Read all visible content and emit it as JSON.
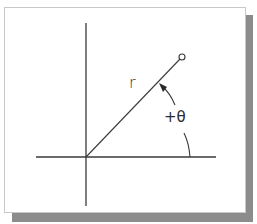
{
  "diagram": {
    "labels": {
      "radius": "r",
      "angle": "+θ"
    },
    "elements": {
      "x_axis": {
        "x1": 36,
        "y1": 157,
        "x2": 216,
        "y2": 157
      },
      "y_axis": {
        "x1": 86,
        "y1": 23,
        "x2": 86,
        "y2": 206
      },
      "radius_line": {
        "x1": 86,
        "y1": 157,
        "x2": 180,
        "y2": 59
      },
      "endpoint_circle": {
        "cx": 182,
        "cy": 57,
        "r": 3
      },
      "angle_arc": {
        "direction": "counterclockwise",
        "arrow": "toward radius line"
      }
    },
    "colors": {
      "line": "#3a3a3a",
      "frame_border": "#c8c8c8",
      "shadow": "#8c8c8c",
      "background": "#ffffff"
    }
  }
}
